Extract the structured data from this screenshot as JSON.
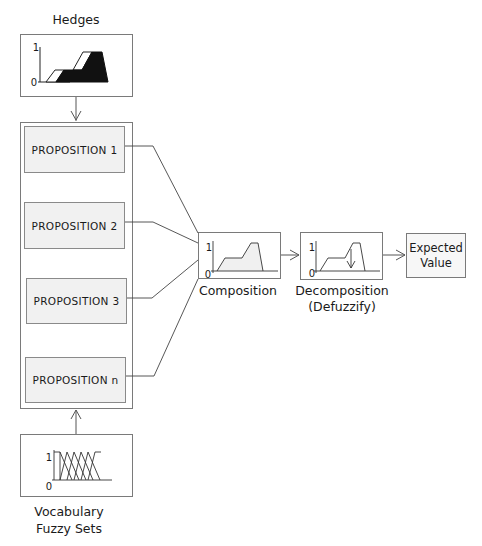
{
  "hedges": {
    "title": "Hedges",
    "axis_top": "1",
    "axis_bottom": "0"
  },
  "propositions": [
    {
      "label": "PROPOSITION 1"
    },
    {
      "label": "PROPOSITION 2"
    },
    {
      "label": "PROPOSITION 3"
    },
    {
      "label": "PROPOSITION n"
    }
  ],
  "vocabulary": {
    "title_line1": "Vocabulary",
    "title_line2": "Fuzzy Sets",
    "axis_top": "1",
    "axis_bottom": "0"
  },
  "composition": {
    "label": "Composition",
    "axis_top": "1",
    "axis_bottom": "0"
  },
  "decomposition": {
    "label_line1": "Decomposition",
    "label_line2": "(Defuzzify)",
    "axis_top": "1",
    "axis_bottom": "0"
  },
  "expected_value": {
    "line1": "Expected",
    "line2": "Value"
  },
  "colors": {
    "line": "#555555",
    "box_border": "#7a7a7a",
    "proposition_fill": "#f1f1f1",
    "hedge_fill": "#111111"
  }
}
